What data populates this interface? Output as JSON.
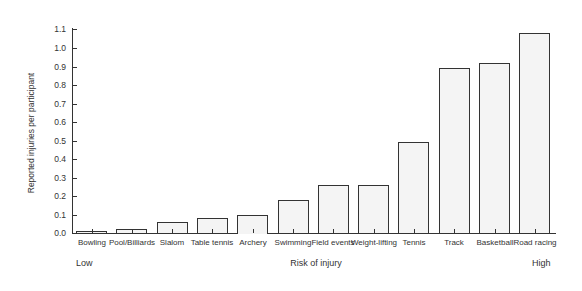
{
  "chart_data": {
    "type": "bar",
    "title": "",
    "xlabel": "Risk of injury",
    "ylabel": "Reported injuries per participant",
    "x_scale_labels": {
      "low": "Low",
      "high": "High"
    },
    "categories": [
      "Bowling",
      "Pool/Billiards",
      "Slalom",
      "Table tennis",
      "Archery",
      "Swimming",
      "Field events",
      "Weight-lifting",
      "Tennis",
      "Track",
      "Basketball",
      "Road racing"
    ],
    "values": [
      0.01,
      0.02,
      0.06,
      0.08,
      0.1,
      0.18,
      0.26,
      0.26,
      0.49,
      0.89,
      0.92,
      1.08
    ],
    "yticks": [
      "0.0",
      "0.1",
      "0.2",
      "0.3",
      "0.4",
      "0.5",
      "0.6",
      "0.7",
      "0.8",
      "0.9",
      "1.0",
      "1.1"
    ],
    "ylim": [
      0,
      1.1
    ],
    "grid": false,
    "legend": null
  }
}
